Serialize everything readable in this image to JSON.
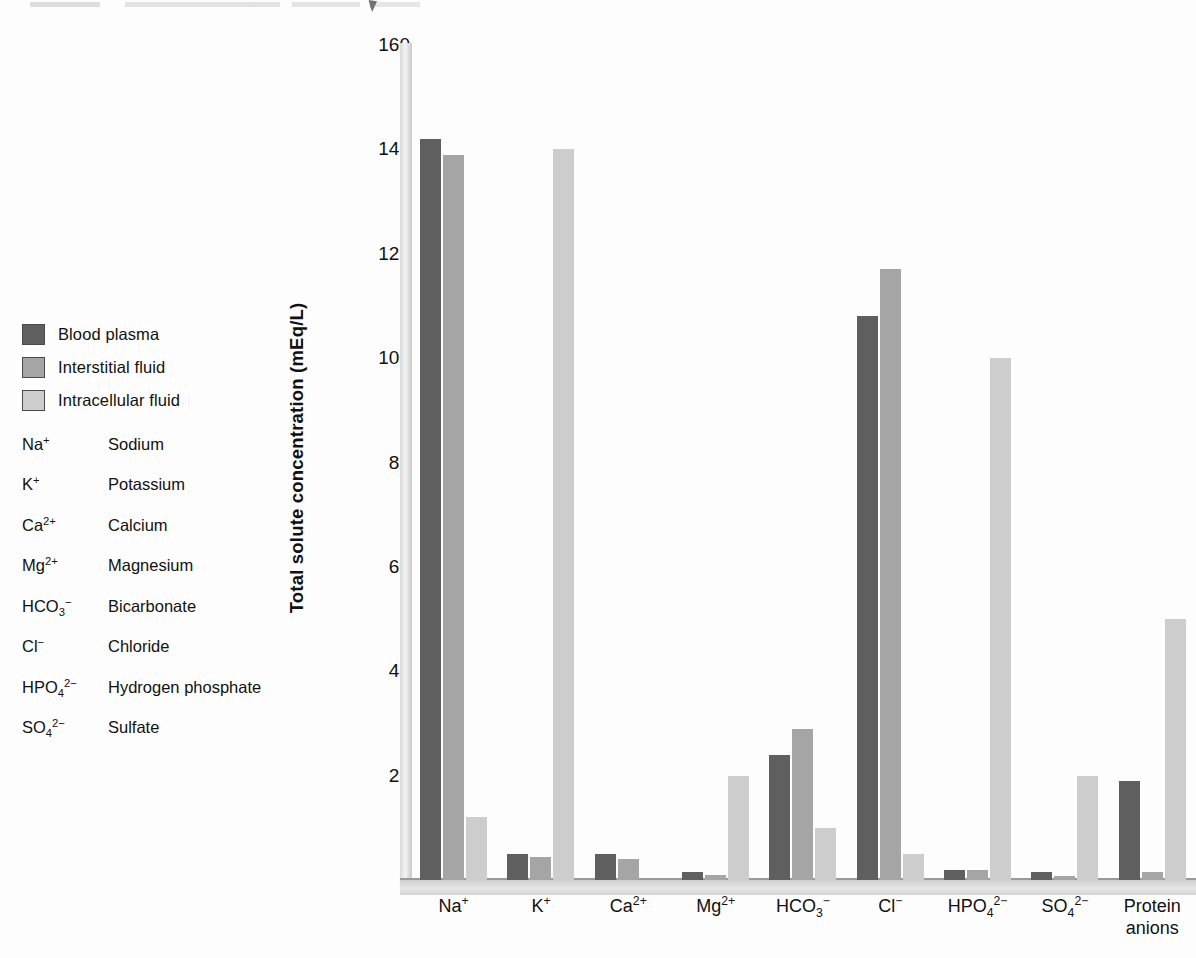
{
  "chart_data": {
    "type": "bar",
    "title": "",
    "xlabel": "",
    "ylabel": "Total solute concentration (mEq/L)",
    "ylim": [
      0,
      160
    ],
    "yticks": [
      0,
      20,
      40,
      60,
      80,
      100,
      120,
      140,
      160
    ],
    "grid": false,
    "legend_position": "left",
    "categories": [
      "Na⁺",
      "K⁺",
      "Ca²⁺",
      "Mg²⁺",
      "HCO₃⁻",
      "Cl⁻",
      "HPO₄²⁻",
      "SO₄²⁻",
      "Protein anions"
    ],
    "series": [
      {
        "name": "Blood plasma",
        "color": "#5f5f5f",
        "values": [
          142,
          5,
          5,
          1.5,
          24,
          108,
          2,
          1.5,
          19
        ]
      },
      {
        "name": "Interstitial fluid",
        "color": "#a5a5a5",
        "values": [
          139,
          4.5,
          4,
          1,
          29,
          117,
          2,
          0.8,
          1.5
        ]
      },
      {
        "name": "Intracellular fluid",
        "color": "#cdcdcd",
        "values": [
          12,
          140,
          0,
          20,
          10,
          5,
          100,
          20,
          50
        ]
      }
    ]
  },
  "legend": {
    "items": [
      {
        "label": "Blood plasma",
        "color": "#5f5f5f"
      },
      {
        "label": "Interstitial fluid",
        "color": "#a5a5a5"
      },
      {
        "label": "Intracellular fluid",
        "color": "#cdcdcd"
      }
    ]
  },
  "ion_key": [
    {
      "symbol_html": "Na<sup>+</sup>",
      "name": "Sodium"
    },
    {
      "symbol_html": "K<sup>+</sup>",
      "name": "Potassium"
    },
    {
      "symbol_html": "Ca<sup>2+</sup>",
      "name": "Calcium"
    },
    {
      "symbol_html": "Mg<sup>2+</sup>",
      "name": "Magnesium"
    },
    {
      "symbol_html": "HCO<sub>3</sub><sup>−</sup>",
      "name": "Bicarbonate"
    },
    {
      "symbol_html": "Cl<sup>−</sup>",
      "name": "Chloride"
    },
    {
      "symbol_html": "HPO<sub>4</sub><sup>2−</sup>",
      "name": "Hydrogen phosphate"
    },
    {
      "symbol_html": "SO<sub>4</sub><sup>2−</sup>",
      "name": "Sulfate"
    }
  ],
  "x_axis_labels_html": [
    "Na<sup>+</sup>",
    "K<sup>+</sup>",
    "Ca<sup>2+</sup>",
    "Mg<sup>2+</sup>",
    "HCO<sub>3</sub><sup>−</sup>",
    "Cl<sup>−</sup>",
    "HPO<sub>4</sub><sup>2−</sup>",
    "SO<sub>4</sub><sup>2−</sup>",
    "Protein<br>anions"
  ]
}
